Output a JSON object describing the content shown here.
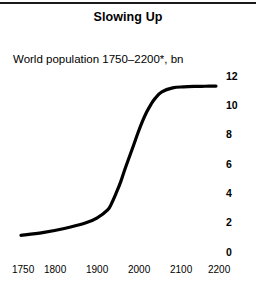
{
  "figure": {
    "title": "Slowing Up",
    "subtitle": "World population 1750–2200*, bn",
    "has_top_rule": true,
    "background_color": "#ffffff",
    "line_color": "#000000"
  },
  "chart_data": {
    "type": "line",
    "title": "Slowing Up",
    "subtitle": "World population 1750–2200*, bn",
    "xlabel": "",
    "ylabel": "bn",
    "xlim": [
      1750,
      2200
    ],
    "ylim": [
      0,
      12
    ],
    "grid": false,
    "legend": null,
    "y_axis_position": "right",
    "x_ticks": [
      1750,
      1800,
      1900,
      2000,
      2100,
      2200
    ],
    "x_tick_labels": [
      "1750",
      "1800",
      "1900",
      "2000",
      "2100",
      "2200"
    ],
    "y_ticks": [
      0,
      2,
      4,
      6,
      8,
      10,
      12
    ],
    "y_tick_labels": [
      "0",
      "2",
      "4",
      "6",
      "8",
      "10",
      "12"
    ],
    "annotations": [
      "* Forecast"
    ],
    "series": [
      {
        "name": "World population",
        "x": [
          1750,
          1800,
          1850,
          1900,
          1925,
          1950,
          1960,
          1970,
          1980,
          1990,
          2000,
          2010,
          2020,
          2030,
          2040,
          2050,
          2060,
          2075,
          2100,
          2125,
          2150,
          2175,
          2200
        ],
        "values": [
          0.79,
          0.98,
          1.26,
          1.65,
          1.97,
          2.53,
          3.03,
          3.7,
          4.44,
          5.32,
          6.14,
          6.96,
          7.79,
          8.55,
          9.2,
          9.73,
          10.15,
          10.58,
          10.85,
          10.92,
          10.95,
          10.96,
          10.97
        ]
      }
    ]
  },
  "axis_layout": {
    "y_tick_pixel_tops": [
      71,
      100,
      129,
      159,
      188,
      217,
      247
    ],
    "x_tick_pixel_lefts": [
      12,
      44,
      86,
      128,
      170,
      208
    ]
  }
}
